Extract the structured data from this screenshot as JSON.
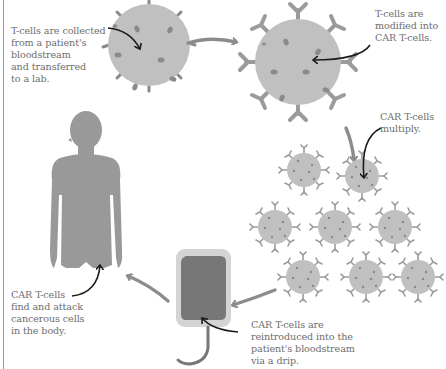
{
  "diagram": {
    "colors": {
      "cell": "#c0c0c0",
      "spot": "#8a8a8a",
      "receptor": "#9b9b9b",
      "arrow_gray": "#8c8c8c",
      "arrow_black": "#1a1a1a",
      "body": "#999999",
      "bag_outer": "#d4d4d4",
      "bag_inner": "#777777",
      "text": "#6e6e6e"
    },
    "steps": [
      {
        "id": "collect",
        "text": "T-cells are collected\nfrom a patient's\nbloodstream\nand transferred\nto a lab."
      },
      {
        "id": "modify",
        "text": "T-cells are\nmodified into\nCAR T-cells."
      },
      {
        "id": "multiply",
        "text": "CAR T-cells\nmultiply."
      },
      {
        "id": "reintroduce",
        "text": "CAR T-cells are\nreintroduced into the\npatient's bloodstream\nvia a drip."
      },
      {
        "id": "attack",
        "text": "CAR T-cells\nfind and attack\ncancerous cells\nin the body."
      }
    ],
    "elements": {
      "t_cell": "t-cell",
      "car_t_cell": "car-t-cell",
      "cell_cluster_count": 8,
      "drip_bag": "iv-drip-bag",
      "human_figure": "human-silhouette"
    }
  }
}
